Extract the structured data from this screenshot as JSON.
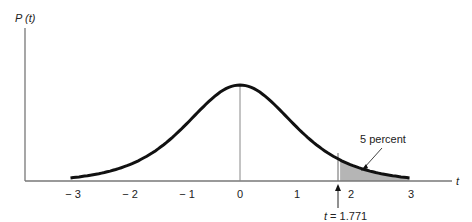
{
  "chart_data": {
    "type": "area",
    "title": "",
    "ylabel": "P (t)",
    "xlabel": "t",
    "xlim": [
      -3,
      3
    ],
    "ticks": [
      {
        "value": -3,
        "label": "− 3"
      },
      {
        "value": -2,
        "label": "− 2"
      },
      {
        "value": -1,
        "label": "− 1"
      },
      {
        "value": 0,
        "label": "0"
      },
      {
        "value": 1,
        "label": "1"
      },
      {
        "value": 2,
        "label": "2"
      },
      {
        "value": 3,
        "label": "3"
      }
    ],
    "curve": "Student t density (symmetric, peak at t = 0)",
    "shaded_region": {
      "from": 1.771,
      "to": 3,
      "area_percent": 5
    },
    "annotations": [
      {
        "text": "5 percent",
        "points_to": "shaded tail area"
      },
      {
        "text": "t = 1.771",
        "points_to": "critical value on x-axis"
      }
    ],
    "grid": false,
    "legend": null
  },
  "labels": {
    "y_axis": "P (t)",
    "x_axis": "t",
    "shade_label": "5 percent",
    "critical_label": "t = 1.771"
  },
  "colors": {
    "curve": "#111111",
    "axis": "#777777",
    "shade": "#b5b5b5"
  }
}
